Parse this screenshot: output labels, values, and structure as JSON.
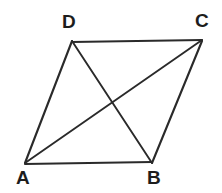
{
  "figure": {
    "name": "parallelogram-with-diagonals",
    "background_color": "#ffffff",
    "line_color": "#2a2a2a",
    "label_color": "#1d1d1d",
    "canvas": {
      "width": 222,
      "height": 193
    },
    "vertices": [
      {
        "label": "A",
        "x": 25,
        "y": 163,
        "label_x": 16,
        "label_y": 168,
        "label_position": "below-left"
      },
      {
        "label": "B",
        "x": 152,
        "y": 163,
        "label_x": 147,
        "label_y": 168,
        "label_position": "below"
      },
      {
        "label": "C",
        "x": 202,
        "y": 40,
        "label_x": 195,
        "label_y": 11,
        "label_position": "above-right"
      },
      {
        "label": "D",
        "x": 72,
        "y": 41,
        "label_x": 62,
        "label_y": 12,
        "label_position": "above"
      }
    ],
    "edges": [
      {
        "name": "edge-AB",
        "from": "A",
        "to": "B",
        "path": "M 25 164 L 152 162"
      },
      {
        "name": "edge-BC",
        "from": "B",
        "to": "C",
        "path": "M 152 163 L 202 41"
      },
      {
        "name": "edge-CD",
        "from": "C",
        "to": "D",
        "path": "M 202 40 L 72 42"
      },
      {
        "name": "edge-DA",
        "from": "D",
        "to": "A",
        "path": "M 72 41 L 25 163"
      }
    ],
    "diagonals": [
      {
        "name": "diagonal-AC",
        "from": "A",
        "to": "C",
        "path": "M 25 163 L 202 40"
      },
      {
        "name": "diagonal-DB",
        "from": "D",
        "to": "B",
        "path": "M 72 41 L 152 163"
      }
    ],
    "intersection": {
      "name": "diagonal-intersection",
      "x": 110,
      "y": 102
    }
  }
}
